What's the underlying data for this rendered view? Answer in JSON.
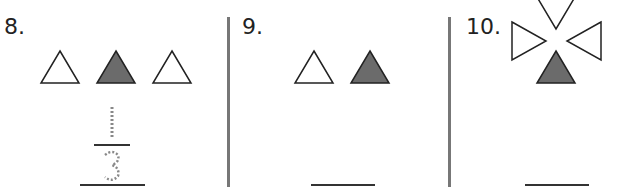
{
  "problems": [
    {
      "number": "8.",
      "shapes": [
        "triangle-outline",
        "triangle-filled",
        "triangle-outline"
      ],
      "fraction": {
        "numerator": "1",
        "denominator": "3",
        "style": "dotted-trace"
      }
    },
    {
      "number": "9.",
      "shapes": [
        "triangle-outline",
        "triangle-filled"
      ],
      "answer": ""
    },
    {
      "number": "10.",
      "shapes": [
        "triangle-outline-down",
        "triangle-outline-right",
        "triangle-outline-left",
        "triangle-filled-up"
      ],
      "answer": ""
    }
  ],
  "colors": {
    "filled": "#6b6b6b",
    "outline": "#222222",
    "divider": "#777777",
    "trace": "#888888"
  }
}
